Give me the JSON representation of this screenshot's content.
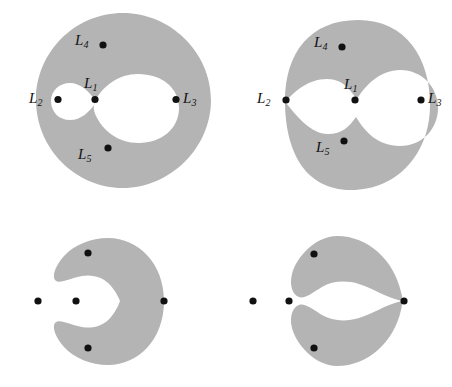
{
  "figure": {
    "type": "mathematical-diagram",
    "colors": {
      "region_fill": "#b4b4b4",
      "point": "#111111",
      "label": "#111111",
      "background": "#ffffff"
    },
    "point_labels": {
      "l1": "L",
      "l1_sub": "1",
      "l2": "L",
      "l2_sub": "2",
      "l3": "L",
      "l3_sub": "3",
      "l4": "L",
      "l4_sub": "4",
      "l5": "L",
      "l5_sub": "5"
    },
    "panels": [
      {
        "name": "top-left",
        "shape": "annulus-with-two-inner-holes",
        "notes": "Large gray disk containing one big circular hole on the right and one small oval hole on the left, the two holes touching at a single pinch point marked L1",
        "points": [
          {
            "label": "L1",
            "sub": "1",
            "position": "pinch point between the two holes"
          },
          {
            "label": "L2",
            "sub": "2",
            "position": "left, inside gray band"
          },
          {
            "label": "L3",
            "sub": "3",
            "position": "right, inside gray band"
          },
          {
            "label": "L4",
            "sub": "4",
            "position": "top, inside gray band"
          },
          {
            "label": "L5",
            "sub": "5",
            "position": "bottom, inside gray band"
          }
        ]
      },
      {
        "name": "top-right",
        "shape": "annulus-with-merged-peanut-hole",
        "notes": "The two holes have merged into one peanut shaped hole which now reaches the left outer boundary at L2; L1 lies inside the hole",
        "points": [
          {
            "label": "L1",
            "sub": "1",
            "position": "inside the merged hole"
          },
          {
            "label": "L2",
            "sub": "2",
            "position": "left boundary pinch point"
          },
          {
            "label": "L3",
            "sub": "3",
            "position": "right, inside gray band"
          },
          {
            "label": "L4",
            "sub": "4",
            "position": "top, inside gray band"
          },
          {
            "label": "L5",
            "sub": "5",
            "position": "bottom, inside gray band"
          }
        ]
      },
      {
        "name": "bottom-left",
        "shape": "c-shape-open-left",
        "notes": "Region has opened on the left into a C shape; L1 and L2 lie outside the gray region, L3 sits on the inner boundary at the right",
        "points": [
          {
            "label": "L1",
            "sub": "1",
            "position": "outside, inside the C opening"
          },
          {
            "label": "L2",
            "sub": "2",
            "position": "far outside left"
          },
          {
            "label": "L3",
            "sub": "3",
            "position": "on inner boundary at right"
          },
          {
            "label": "L4",
            "sub": "4",
            "position": "upper arm of the C"
          },
          {
            "label": "L5",
            "sub": "5",
            "position": "lower arm of the C"
          }
        ]
      },
      {
        "name": "bottom-right",
        "shape": "two-disjoint-crescents",
        "notes": "The C has pinched apart at the right into two separate crescents; L3 sits in the gap between them",
        "points": [
          {
            "label": "L1",
            "sub": "1",
            "position": "in the open center"
          },
          {
            "label": "L2",
            "sub": "2",
            "position": "far outside left"
          },
          {
            "label": "L3",
            "sub": "3",
            "position": "in the right gap between crescents"
          },
          {
            "label": "L4",
            "sub": "4",
            "position": "upper crescent"
          },
          {
            "label": "L5",
            "sub": "5",
            "position": "lower crescent"
          }
        ]
      }
    ]
  }
}
